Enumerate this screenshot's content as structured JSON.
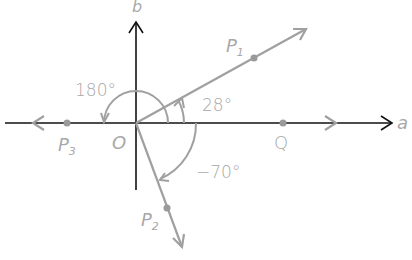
{
  "diagram": {
    "axes": {
      "horizontal_label": "a",
      "vertical_label": "b",
      "origin_label": "O"
    },
    "points": [
      {
        "name": "P",
        "subscript": "1",
        "angle": "28°"
      },
      {
        "name": "P",
        "subscript": "2",
        "angle": "-70°"
      },
      {
        "name": "P",
        "subscript": "3",
        "angle": "180°"
      },
      {
        "name": "Q",
        "subscript": "",
        "angle": "0°"
      }
    ],
    "angle_labels": {
      "a28": "28°",
      "a180": "180°",
      "aminus70": "−70°"
    },
    "colors": {
      "axis": "#111111",
      "ray": "#a0a0a0",
      "label": "#a8a8a8",
      "point": "#9a9a9a"
    }
  }
}
